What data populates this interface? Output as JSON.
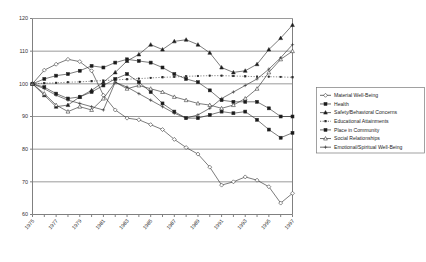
{
  "chart_data": {
    "type": "line",
    "title": "",
    "xlabel": "",
    "ylabel": "",
    "xlim": [
      1975,
      1997
    ],
    "ylim": [
      60,
      120
    ],
    "yticks": [
      60,
      70,
      80,
      90,
      100,
      110,
      120
    ],
    "xticks": [
      1975,
      1977,
      1979,
      1981,
      1983,
      1985,
      1987,
      1989,
      1991,
      1993,
      1995,
      1997
    ],
    "xtick_labels": [
      "1975",
      "1977",
      "1979",
      "1981",
      "1983",
      "1985",
      "1987",
      "1989",
      "1991",
      "1993",
      "1995",
      "1997"
    ],
    "ytick_labels": [
      "60",
      "70",
      "80",
      "90",
      "100",
      "110",
      "120"
    ],
    "grid": true,
    "grid_axis": "y",
    "legend_position": "right",
    "x": [
      1975,
      1976,
      1977,
      1978,
      1979,
      1980,
      1981,
      1982,
      1983,
      1984,
      1985,
      1986,
      1987,
      1988,
      1989,
      1990,
      1991,
      1992,
      1993,
      1994,
      1995,
      1996,
      1997
    ],
    "series": [
      {
        "name": "Material Well-Being",
        "marker": "diamond-open",
        "line": "solid",
        "values": [
          100.0,
          104.2,
          106.0,
          107.5,
          106.8,
          104.0,
          96.5,
          92.0,
          89.5,
          89.0,
          87.5,
          86.0,
          83.0,
          80.5,
          78.5,
          74.5,
          69.0,
          70.0,
          71.5,
          70.5,
          68.5,
          63.5,
          66.5
        ]
      },
      {
        "name": "Health",
        "marker": "square-filled",
        "line": "solid",
        "values": [
          100.0,
          101.5,
          102.5,
          103.0,
          104.0,
          105.5,
          105.0,
          106.5,
          107.5,
          107.0,
          106.5,
          105.0,
          103.0,
          101.5,
          100.5,
          98.0,
          95.0,
          94.5,
          94.5,
          94.5,
          92.5,
          90.0,
          90.0
        ]
      },
      {
        "name": "Safety/Behavioral Concerns",
        "marker": "triangle-filled",
        "line": "solid",
        "values": [
          100.0,
          96.5,
          93.0,
          93.5,
          96.0,
          98.0,
          100.5,
          103.5,
          107.0,
          109.0,
          112.0,
          110.5,
          113.0,
          113.5,
          112.0,
          109.5,
          105.0,
          103.5,
          104.0,
          106.0,
          110.5,
          114.0,
          118.0
        ]
      },
      {
        "name": "Educational Attainments",
        "marker": "dot",
        "line": "dotted",
        "values": [
          100.0,
          100.2,
          100.3,
          100.5,
          100.6,
          100.8,
          101.0,
          101.2,
          101.4,
          101.6,
          101.8,
          102.0,
          102.1,
          102.3,
          102.4,
          102.5,
          102.5,
          102.4,
          102.3,
          102.2,
          102.2,
          102.1,
          102.0
        ]
      },
      {
        "name": "Place in Community",
        "marker": "square-filled",
        "line": "solid",
        "values": [
          100.0,
          99.0,
          97.0,
          95.5,
          96.0,
          97.5,
          99.5,
          101.5,
          103.0,
          100.5,
          97.5,
          94.0,
          91.5,
          89.5,
          89.5,
          90.5,
          91.5,
          91.0,
          91.5,
          89.0,
          86.0,
          83.5,
          85.0
        ]
      },
      {
        "name": "Social Relationships",
        "marker": "triangle-open",
        "line": "solid",
        "values": [
          100.0,
          97.0,
          93.5,
          91.5,
          93.0,
          92.0,
          95.5,
          100.5,
          98.5,
          99.5,
          98.5,
          97.5,
          96.0,
          95.0,
          94.0,
          93.5,
          92.5,
          93.5,
          95.5,
          98.5,
          103.5,
          107.5,
          110.0
        ]
      },
      {
        "name": "Emotional/Spiritual Well-Being",
        "marker": "plus",
        "line": "solid",
        "values": [
          100.0,
          98.5,
          96.5,
          95.0,
          94.0,
          93.0,
          92.0,
          100.5,
          99.0,
          97.0,
          95.0,
          93.0,
          91.0,
          89.5,
          90.5,
          92.5,
          95.5,
          97.5,
          99.5,
          101.5,
          104.5,
          108.0,
          112.0
        ]
      }
    ]
  },
  "legend": {
    "items": [
      {
        "label": "Material Well-Being"
      },
      {
        "label": "Health"
      },
      {
        "label": "Safety/Behavioral Concerns"
      },
      {
        "label": "Educational Attainments"
      },
      {
        "label": "Place in Community"
      },
      {
        "label": "Social Relationships"
      },
      {
        "label": "Emotional/Spiritual Well-Being"
      }
    ]
  }
}
